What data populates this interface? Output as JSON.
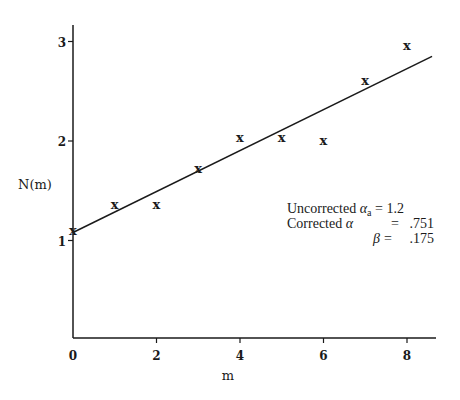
{
  "chart_data": {
    "type": "scatter",
    "title": "",
    "xlabel": "m",
    "ylabel": "N(m)",
    "xlim": [
      0,
      8.6
    ],
    "ylim": [
      0,
      3.2
    ],
    "x_ticks": [
      0,
      2,
      4,
      6,
      8
    ],
    "y_ticks": [
      1,
      2,
      3
    ],
    "grid": false,
    "marker": "x",
    "series": [
      {
        "name": "observed",
        "x": [
          0,
          1,
          2,
          3,
          4,
          5,
          6,
          7,
          8
        ],
        "y": [
          1.1,
          1.36,
          1.36,
          1.72,
          2.03,
          2.03,
          2.0,
          2.6,
          2.95
        ]
      },
      {
        "name": "fit line",
        "type": "line",
        "x": [
          0,
          8.6
        ],
        "y": [
          1.08,
          2.85
        ]
      }
    ],
    "annotations": [
      {
        "label": "Uncorrected α_a",
        "eq": "=",
        "value": "1.2"
      },
      {
        "label": "Corrected α",
        "eq": "=",
        "value": ".751"
      },
      {
        "label": "β",
        "eq": "=",
        "value": ".175"
      }
    ]
  },
  "axes": {
    "xlabel": "m",
    "ylabel": "N(m)",
    "x_tick_labels": [
      "0",
      "2",
      "4",
      "6",
      "8"
    ],
    "y_tick_labels": [
      "1",
      "2",
      "3"
    ]
  },
  "legend": {
    "line1_prefix": "Uncorrected ",
    "line1_symbol": "α",
    "line1_sub": "a",
    "line1_value": " = 1.2",
    "line2_prefix": "Corrected ",
    "line2_symbol": "α",
    "line2_eq": "=",
    "line2_value": ".751",
    "line3_symbol": "β",
    "line3_eq": "=",
    "line3_value": ".175"
  },
  "marker_glyph": "x"
}
